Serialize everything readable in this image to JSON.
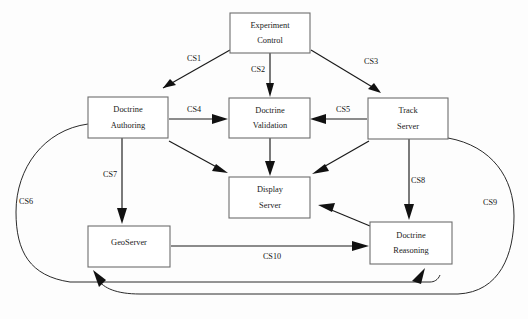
{
  "diagram": {
    "type": "block-flow-diagram",
    "background_color": "#fdfdfd",
    "box_stroke_color": "#6e6e6e",
    "edge_color": "#111111",
    "text_color": "#1a1a1a",
    "nodes": [
      {
        "id": "experiment-control",
        "line1": "Experiment",
        "line2": "Control",
        "x": 230,
        "y": 13,
        "w": 80,
        "h": 40
      },
      {
        "id": "doctrine-authoring",
        "line1": "Doctrine",
        "line2": "Authoring",
        "x": 88,
        "y": 97,
        "w": 80,
        "h": 41
      },
      {
        "id": "doctrine-validation",
        "line1": "Doctrine",
        "line2": "Validation",
        "x": 229,
        "y": 98,
        "w": 81,
        "h": 40
      },
      {
        "id": "track-server",
        "line1": "Track",
        "line2": "Server",
        "x": 368,
        "y": 98,
        "w": 80,
        "h": 41
      },
      {
        "id": "display-server",
        "line1": "Display",
        "line2": "Server",
        "x": 229,
        "y": 177,
        "w": 81,
        "h": 41
      },
      {
        "id": "geoserver",
        "line1": "GeoServer",
        "line2": "",
        "x": 88,
        "y": 226,
        "w": 82,
        "h": 41
      },
      {
        "id": "doctrine-reasoning",
        "line1": "Doctrine",
        "line2": "Reasoning",
        "x": 370,
        "y": 222,
        "w": 82,
        "h": 42
      }
    ],
    "edges": [
      {
        "id": "cs1",
        "label": "CS1",
        "from": "experiment-control",
        "to": "doctrine-authoring",
        "label_x": 194,
        "label_y": 59
      },
      {
        "id": "cs2",
        "label": "CS2",
        "from": "experiment-control",
        "to": "doctrine-validation",
        "label_x": 258,
        "label_y": 70
      },
      {
        "id": "cs3",
        "label": "CS3",
        "from": "experiment-control",
        "to": "track-server",
        "label_x": 371,
        "label_y": 62
      },
      {
        "id": "cs4",
        "label": "CS4",
        "from": "doctrine-authoring",
        "to": "doctrine-validation",
        "label_x": 194,
        "label_y": 111
      },
      {
        "id": "cs5",
        "label": "CS5",
        "from": "track-server",
        "to": "doctrine-validation",
        "label_x": 343,
        "label_y": 111
      },
      {
        "id": "cs6",
        "label": "CS6",
        "from": "doctrine-authoring",
        "to": "doctrine-reasoning",
        "label_x": 26,
        "label_y": 202
      },
      {
        "id": "cs7",
        "label": "CS7",
        "from": "doctrine-authoring",
        "to": "geoserver",
        "label_x": 110,
        "label_y": 175
      },
      {
        "id": "cs8",
        "label": "CS8",
        "from": "track-server",
        "to": "doctrine-reasoning",
        "label_x": 418,
        "label_y": 181
      },
      {
        "id": "cs9",
        "label": "CS9",
        "from": "track-server",
        "to": "geoserver",
        "label_x": 490,
        "label_y": 203
      },
      {
        "id": "cs10",
        "label": "CS10",
        "from": "geoserver",
        "to": "doctrine-reasoning",
        "label_x": 272,
        "label_y": 257
      },
      {
        "id": "authoring-to-display",
        "label": "",
        "from": "doctrine-authoring",
        "to": "display-server",
        "label_x": 0,
        "label_y": 0
      },
      {
        "id": "validation-to-display",
        "label": "",
        "from": "doctrine-validation",
        "to": "display-server",
        "label_x": 0,
        "label_y": 0
      },
      {
        "id": "track-to-display",
        "label": "",
        "from": "track-server",
        "to": "display-server",
        "label_x": 0,
        "label_y": 0
      },
      {
        "id": "reasoning-to-display",
        "label": "",
        "from": "doctrine-reasoning",
        "to": "display-server",
        "label_x": 0,
        "label_y": 0
      }
    ]
  }
}
